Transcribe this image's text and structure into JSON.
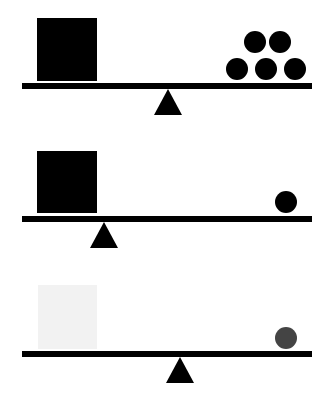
{
  "diagram": {
    "colors": {
      "background": "#ffffff",
      "beam": "#000000",
      "fulcrum": "#000000",
      "square_dark": "#000000",
      "square_light": "#f2f2f2",
      "ball_dark": "#000000",
      "ball_gray": "#444444"
    },
    "panels": [
      {
        "id": "scale-1",
        "square": {
          "x": 37,
          "y": 18,
          "w": 60,
          "h": 63,
          "color": "#000000"
        },
        "beam": {
          "x": 22,
          "y": 83,
          "w": 290,
          "h": 6
        },
        "fulcrum": {
          "apex_x": 168,
          "apex_y": 89,
          "base_y": 115,
          "half_width": 14
        },
        "balls": [
          {
            "cx": 255,
            "cy": 42,
            "r": 11,
            "color": "#000000"
          },
          {
            "cx": 280,
            "cy": 42,
            "r": 11,
            "color": "#000000"
          },
          {
            "cx": 237,
            "cy": 69,
            "r": 11,
            "color": "#000000"
          },
          {
            "cx": 266,
            "cy": 69,
            "r": 11,
            "color": "#000000"
          },
          {
            "cx": 295,
            "cy": 69,
            "r": 11,
            "color": "#000000"
          }
        ]
      },
      {
        "id": "scale-2",
        "square": {
          "x": 37,
          "y": 151,
          "w": 60,
          "h": 62,
          "color": "#000000"
        },
        "beam": {
          "x": 22,
          "y": 216,
          "w": 290,
          "h": 6
        },
        "fulcrum": {
          "apex_x": 104,
          "apex_y": 222,
          "base_y": 248,
          "half_width": 14
        },
        "balls": [
          {
            "cx": 286,
            "cy": 202,
            "r": 11,
            "color": "#000000"
          }
        ]
      },
      {
        "id": "scale-3",
        "square": {
          "x": 38,
          "y": 285,
          "w": 59,
          "h": 64,
          "color": "#f2f2f2"
        },
        "beam": {
          "x": 22,
          "y": 351,
          "w": 290,
          "h": 6
        },
        "fulcrum": {
          "apex_x": 180,
          "apex_y": 357,
          "base_y": 383,
          "half_width": 14
        },
        "balls": [
          {
            "cx": 286,
            "cy": 338,
            "r": 11,
            "color": "#444444"
          }
        ]
      }
    ]
  }
}
